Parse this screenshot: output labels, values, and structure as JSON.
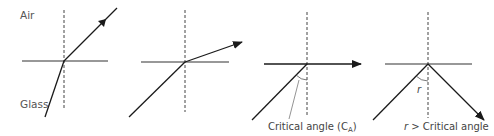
{
  "diagram": {
    "colors": {
      "line": "#1a1a1a",
      "normal": "#444444",
      "text": "#555555"
    },
    "panels": [
      {
        "id": 1,
        "description": "Light refracts away from the normal into air",
        "labels": {
          "top": "Air",
          "bottom": "Glass"
        }
      },
      {
        "id": 2,
        "description": "Larger incident angle, refracted ray closer to surface"
      },
      {
        "id": 3,
        "description": "Incident at critical angle, refracted ray along surface",
        "labels": {
          "caption": "Critical angle (C",
          "caption_sub": "A",
          "caption_end": ")"
        }
      },
      {
        "id": 4,
        "description": "Incident angle greater than critical angle, total internal reflection",
        "labels": {
          "angle": "r",
          "caption_var": "r",
          "caption_rest": " > Critical angle"
        }
      }
    ]
  }
}
